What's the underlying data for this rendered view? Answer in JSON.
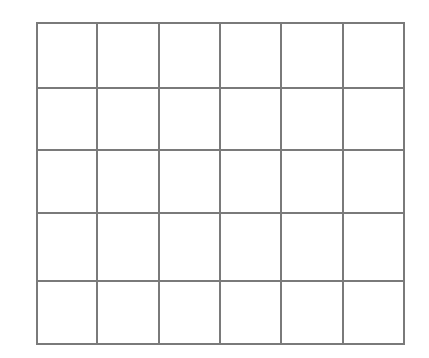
{
  "diagram": {
    "type": "empty-grid",
    "rows": 5,
    "columns": 6,
    "line_color": "#7a7a7a",
    "line_width": 2,
    "background": "#ffffff",
    "column_lines_x": [
      37,
      97,
      159,
      220,
      281,
      343,
      404
    ],
    "row_lines_y": [
      23,
      88,
      150,
      213,
      281,
      344
    ]
  }
}
